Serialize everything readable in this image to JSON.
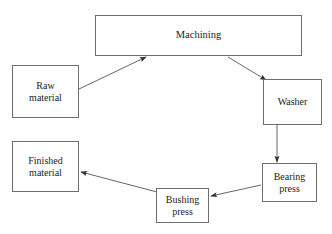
{
  "diagram": {
    "type": "flowchart",
    "background_color": "#ffffff",
    "line_color": "#555555",
    "box_border_color": "#6e6e6e",
    "text_color": "#1a1a1a",
    "nodes": [
      {
        "id": "machining",
        "label": "Machining",
        "x": 95,
        "y": 15,
        "w": 207,
        "h": 41
      },
      {
        "id": "raw_material",
        "label": "Raw\nmaterial",
        "x": 12,
        "y": 65,
        "w": 67,
        "h": 53
      },
      {
        "id": "washer",
        "label": "Washer",
        "x": 263,
        "y": 79,
        "w": 59,
        "h": 46
      },
      {
        "id": "bearing_press",
        "label": "Bearing\npress",
        "x": 262,
        "y": 163,
        "w": 55,
        "h": 39
      },
      {
        "id": "bushing_press",
        "label": "Bushing\npress",
        "x": 156,
        "y": 188,
        "w": 53,
        "h": 35
      },
      {
        "id": "finished_material",
        "label": "Finished\nmaterial",
        "x": 12,
        "y": 141,
        "w": 67,
        "h": 51
      }
    ],
    "edges": [
      {
        "id": "raw-to-machining",
        "from": "raw_material",
        "to": "machining",
        "label": "",
        "x1": 79,
        "y1": 89,
        "x2": 146,
        "y2": 57
      },
      {
        "id": "machining-to-washer",
        "from": "machining",
        "to": "washer",
        "label": "",
        "x1": 228,
        "y1": 57,
        "x2": 266,
        "y2": 80
      },
      {
        "id": "washer-to-bearing",
        "from": "washer",
        "to": "bearing_press",
        "label": "",
        "x1": 277,
        "y1": 125,
        "x2": 277,
        "y2": 162
      },
      {
        "id": "bearing-to-bushing",
        "from": "bearing_press",
        "to": "bushing_press",
        "label": "",
        "x1": 261,
        "y1": 185,
        "x2": 211,
        "y2": 196
      },
      {
        "id": "bushing-to-finished",
        "from": "bushing_press",
        "to": "finished_material",
        "label": "",
        "x1": 157,
        "y1": 192,
        "x2": 81,
        "y2": 172
      }
    ]
  }
}
